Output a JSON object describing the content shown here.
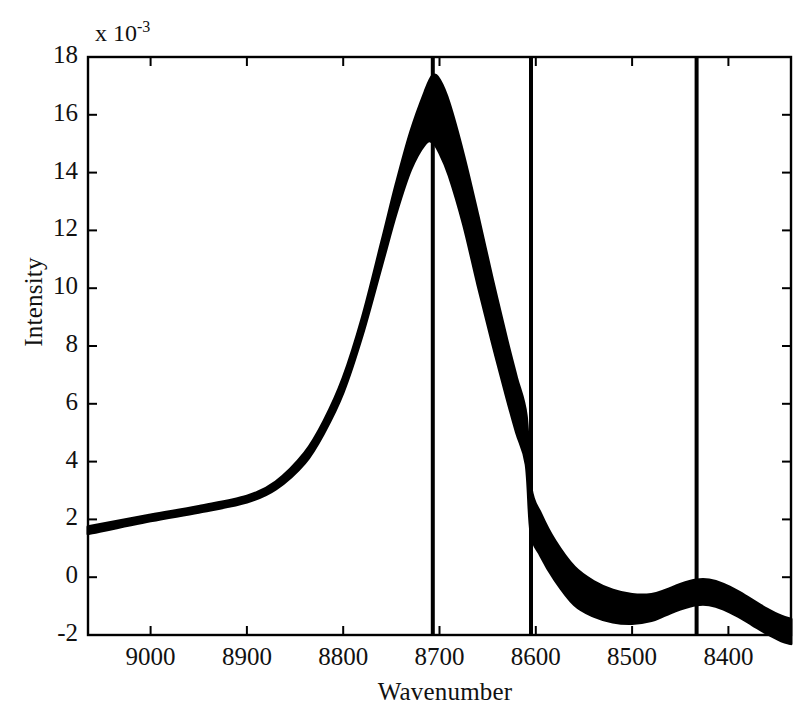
{
  "figure": {
    "exponent_label": "x 10",
    "exponent_power": "-3",
    "xlabel": "Wavenumber",
    "ylabel": "Intensity",
    "background_color": "#ffffff",
    "ink_color": "#000000"
  },
  "chart_data": {
    "type": "line",
    "title": "",
    "subtitle": "",
    "xlabel": "Wavenumber",
    "ylabel": "Intensity",
    "y_scale_factor": "x 10^-3",
    "grid": false,
    "legend": "none",
    "xlim": [
      9065,
      8335
    ],
    "ylim": [
      -2,
      18
    ],
    "x_axis_direction": "reversed",
    "xticks": [
      9000,
      8900,
      8800,
      8700,
      8600,
      8500,
      8400
    ],
    "xticklabels": [
      "9000",
      "8900",
      "8800",
      "8700",
      "8600",
      "8500",
      "8400"
    ],
    "yticks": [
      18,
      16,
      14,
      12,
      10,
      8,
      6,
      4,
      2,
      0,
      -2
    ],
    "yticklabels": [
      "18",
      "16",
      "14",
      "12",
      "10",
      "8",
      "6",
      "4",
      "2",
      "0",
      "-2"
    ],
    "x": [
      9065,
      9000,
      8950,
      8900,
      8870,
      8840,
      8820,
      8800,
      8780,
      8760,
      8745,
      8730,
      8715,
      8707,
      8700,
      8690,
      8675,
      8660,
      8645,
      8630,
      8620,
      8610,
      8605,
      8595,
      8580,
      8560,
      8540,
      8520,
      8500,
      8480,
      8465,
      8450,
      8433,
      8420,
      8405,
      8390,
      8375,
      8360,
      8345,
      8335
    ],
    "series": [
      {
        "name": "upper envelope",
        "values": [
          1.75,
          2.15,
          2.45,
          2.8,
          3.3,
          4.3,
          5.4,
          6.9,
          9.0,
          11.6,
          13.6,
          15.4,
          16.8,
          17.35,
          17.2,
          16.4,
          14.6,
          12.5,
          10.3,
          8.2,
          6.9,
          5.6,
          3.1,
          2.2,
          1.25,
          0.35,
          -0.15,
          -0.45,
          -0.6,
          -0.6,
          -0.45,
          -0.25,
          -0.1,
          -0.1,
          -0.25,
          -0.5,
          -0.8,
          -1.1,
          -1.35,
          -1.45
        ]
      },
      {
        "name": "lower envelope",
        "values": [
          1.5,
          1.95,
          2.25,
          2.6,
          3.05,
          3.95,
          5.0,
          6.4,
          8.4,
          10.8,
          12.6,
          14.1,
          15.0,
          15.05,
          14.7,
          13.9,
          12.2,
          10.1,
          8.1,
          6.2,
          5.0,
          3.9,
          1.55,
          0.75,
          -0.1,
          -0.95,
          -1.35,
          -1.55,
          -1.6,
          -1.5,
          -1.3,
          -1.1,
          -0.95,
          -0.95,
          -1.1,
          -1.35,
          -1.65,
          -1.95,
          -2.2,
          -2.3
        ]
      }
    ],
    "band_description": "Dense ensemble of near-identical spectra drawn as a solid filled black band between the upper and lower envelopes",
    "annotations": [
      {
        "type": "vline",
        "x": 8707,
        "label": ""
      },
      {
        "type": "vline",
        "x": 8605,
        "label": ""
      },
      {
        "type": "vline",
        "x": 8433,
        "label": ""
      }
    ]
  }
}
